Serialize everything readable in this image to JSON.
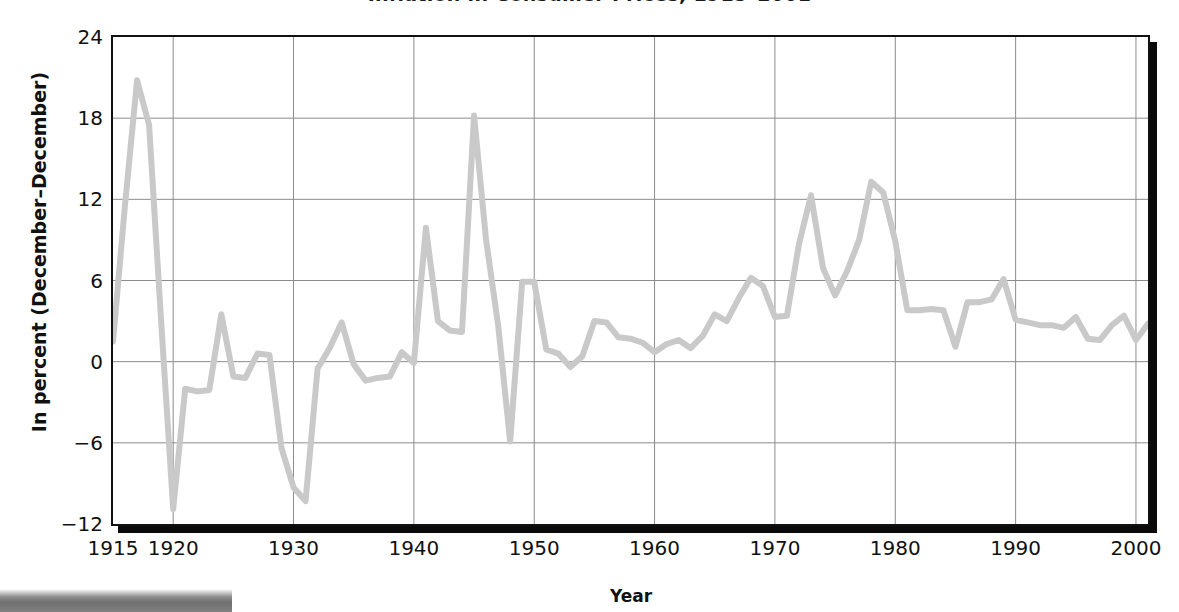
{
  "chart_data": {
    "type": "line",
    "title": "Inflation in Consumer Prices, 1915–2001",
    "xlabel": "Year",
    "ylabel": "In percent (December–December)",
    "xlim": [
      1915,
      2001
    ],
    "ylim": [
      -12,
      24
    ],
    "yticks": [
      24,
      18,
      12,
      6,
      0,
      -6,
      -12
    ],
    "ytick_labels": [
      "24",
      "18",
      "12",
      "6",
      "0",
      "−6",
      "−12"
    ],
    "xticks": [
      1915,
      1920,
      1930,
      1940,
      1950,
      1960,
      1970,
      1980,
      1990,
      2000
    ],
    "xtick_labels": [
      "1915",
      "1920",
      "1930",
      "1940",
      "1950",
      "1960",
      "1970",
      "1980",
      "1990",
      "2000"
    ],
    "grid": true,
    "legend": "none",
    "line_color": "#c9c9c9",
    "line_width": 6,
    "series": [
      {
        "name": "Inflation in consumer prices (December–December)",
        "x": [
          1915,
          1916,
          1917,
          1918,
          1919,
          1920,
          1921,
          1922,
          1923,
          1924,
          1925,
          1926,
          1927,
          1928,
          1929,
          1930,
          1931,
          1932,
          1933,
          1934,
          1935,
          1936,
          1937,
          1938,
          1939,
          1940,
          1941,
          1942,
          1943,
          1944,
          1945,
          1946,
          1947,
          1948,
          1949,
          1950,
          1951,
          1952,
          1953,
          1954,
          1955,
          1956,
          1957,
          1958,
          1959,
          1960,
          1961,
          1962,
          1963,
          1964,
          1965,
          1966,
          1967,
          1968,
          1969,
          1970,
          1971,
          1972,
          1973,
          1974,
          1975,
          1976,
          1977,
          1978,
          1979,
          1980,
          1981,
          1982,
          1983,
          1984,
          1985,
          1986,
          1987,
          1988,
          1989,
          1990,
          1991,
          1992,
          1993,
          1994,
          1995,
          1996,
          1997,
          1998,
          1999,
          2000,
          2001
        ],
        "y": [
          1.5,
          11.6,
          20.8,
          17.5,
          3.0,
          -10.9,
          -2.0,
          -2.2,
          -2.1,
          3.5,
          -1.1,
          -1.2,
          0.6,
          0.5,
          -6.4,
          -9.3,
          -10.3,
          -0.5,
          1.0,
          2.9,
          -0.2,
          -1.4,
          -1.2,
          -1.1,
          0.7,
          -0.1,
          9.9,
          3.0,
          2.3,
          2.2,
          18.2,
          9.0,
          2.7,
          -5.9,
          5.9,
          5.9,
          0.9,
          0.6,
          -0.4,
          0.4,
          3.0,
          2.9,
          1.8,
          1.7,
          1.4,
          0.7,
          1.3,
          1.6,
          1.0,
          1.9,
          3.5,
          3.0,
          4.7,
          6.2,
          5.6,
          3.3,
          3.4,
          8.7,
          12.3,
          6.9,
          4.9,
          6.7,
          9.0,
          13.3,
          12.5,
          8.9,
          3.8,
          3.8,
          3.9,
          3.8,
          1.1,
          4.4,
          4.4,
          4.6,
          6.1,
          3.1,
          2.9,
          2.7,
          2.7,
          2.5,
          3.3,
          1.7,
          1.6,
          2.7,
          3.4,
          1.6,
          2.8
        ]
      }
    ]
  },
  "axes": {
    "title": "Inflation in Consumer Prices, 1915–2001",
    "x_title": "Year",
    "y_title": "In percent (December–December)"
  },
  "bottom_bar": {
    "label": ""
  }
}
